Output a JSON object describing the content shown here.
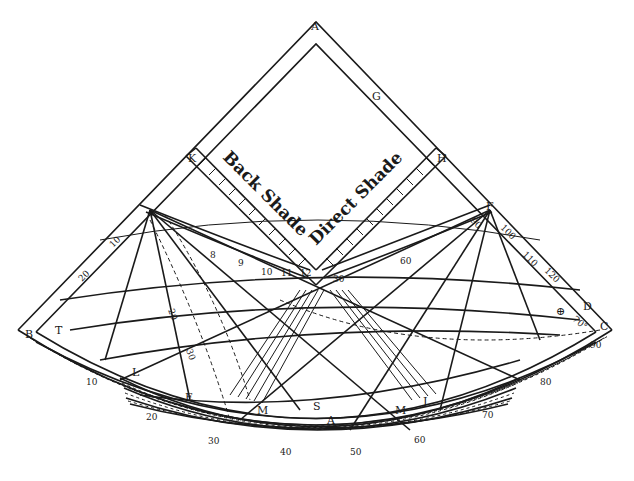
{
  "diagram": {
    "colors": {
      "ink": "#1a1a1a",
      "paper": "#ffffff"
    },
    "scale_titles": {
      "back_shade": "Back Shade",
      "direct_shade": "Direct Shade"
    },
    "point_labels": {
      "A_top": "A",
      "G": "G",
      "H": "H",
      "K": "K",
      "F": "F",
      "D": "D",
      "C": "C",
      "B": "B",
      "T": "T",
      "L": "L",
      "E": "E",
      "M_left": "M",
      "S": "S",
      "A_bottom": "A",
      "M_right": "M",
      "J": "J"
    },
    "right_edge_scale": [
      "90",
      "100",
      "110",
      "120"
    ],
    "inner_arc_labels": [
      "8",
      "9",
      "10",
      "11",
      "12",
      "30",
      "60"
    ],
    "left_edge_scale": [
      "10",
      "20"
    ],
    "bottom_arc_outer": [
      "10",
      "20",
      "30",
      "40",
      "50",
      "60",
      "70",
      "80",
      "90"
    ],
    "misc_labels": {
      "angle_70": "70°",
      "twenty": "20",
      "thirty": "30",
      "sun_symbol": "⊕"
    }
  }
}
